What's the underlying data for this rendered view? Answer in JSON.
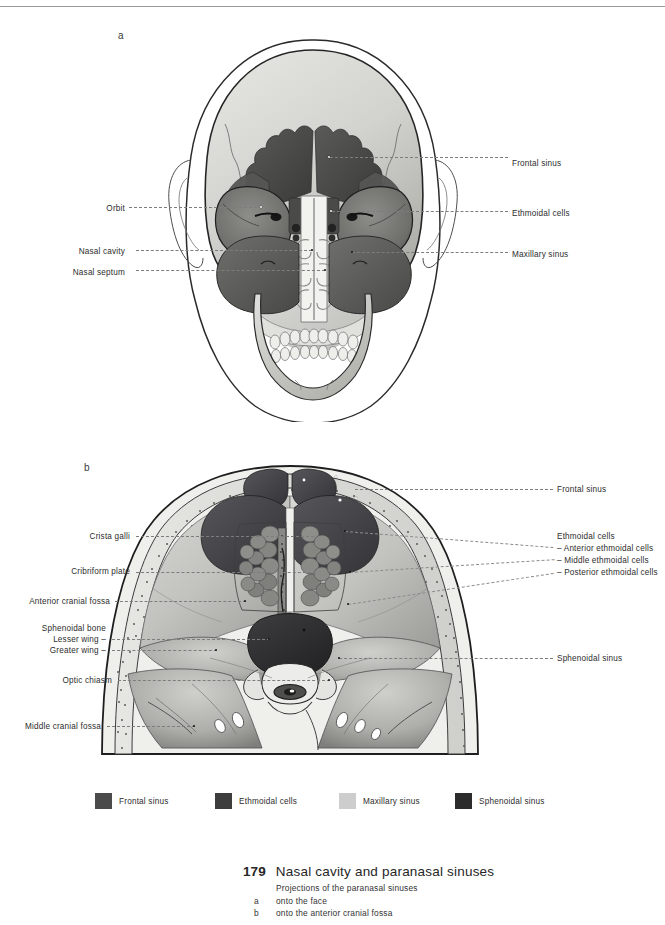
{
  "page": {
    "background": "#ffffff",
    "width": 665,
    "height": 925
  },
  "panels": {
    "a": {
      "letter": "a"
    },
    "b": {
      "letter": "b"
    }
  },
  "figure_a": {
    "view": "anterior view of skull with paranasal sinus projections onto the face",
    "labels_right": [
      {
        "text": "Frontal sinus",
        "x": 512,
        "y": 158,
        "line_from_x": 330,
        "line_y": 157
      },
      {
        "text": "Ethmoidal cells",
        "x": 512,
        "y": 208,
        "line_from_x": 332,
        "line_y": 211
      },
      {
        "text": "Maxillary sinus",
        "x": 512,
        "y": 249,
        "line_from_x": 352,
        "line_y": 252
      }
    ],
    "labels_left": [
      {
        "text": "Orbit",
        "x": 99,
        "y": 203,
        "line_to_x": 262,
        "line_y": 207
      },
      {
        "text": "Nasal cavity",
        "x": 82,
        "y": 246,
        "line_to_x": 312,
        "line_y": 250
      },
      {
        "text": "Nasal septum",
        "x": 69,
        "y": 267,
        "line_to_x": 325,
        "line_y": 270
      }
    ]
  },
  "figure_b": {
    "view": "anterior cranial fossa viewed from above with paranasal sinus projections",
    "labels_left": [
      {
        "text": "Crista galli",
        "x": 82,
        "y": 532,
        "line_to_x": 311,
        "line_y": 536
      },
      {
        "text": "Cribriform plate",
        "x": 58,
        "y": 567,
        "line_to_x": 312,
        "line_y": 572
      },
      {
        "text": "Anterior cranial fossa",
        "x": 8,
        "y": 597,
        "line_to_x": 245,
        "line_y": 601
      },
      {
        "text": "Sphenoidal bone",
        "x": 28,
        "y": 624,
        "line_to_x": null,
        "line_y": null
      },
      {
        "text": "Lesser wing –",
        "x": 38,
        "y": 636,
        "line_to_x": 269,
        "line_y": 639
      },
      {
        "text": "Greater wing –",
        "x": 31,
        "y": 648,
        "line_to_x": 216,
        "line_y": 650
      },
      {
        "text": "Optic chiasm",
        "x": 63,
        "y": 677,
        "line_to_x": 329,
        "line_y": 680
      },
      {
        "text": "Middle cranial fossa",
        "x": 18,
        "y": 724,
        "line_to_x": 194,
        "line_y": 726
      }
    ],
    "labels_right": [
      {
        "text": "Frontal sinus",
        "x": 557,
        "y": 487,
        "line_from_x": 355,
        "line_y": 489
      },
      {
        "text": "Ethmoidal cells",
        "x": 557,
        "y": 535,
        "line_from_x": null,
        "line_y": null
      },
      {
        "text": "– Anterior ethmoidal cells",
        "x": 557,
        "y": 547,
        "line_from_x": 345,
        "line_y": 531
      },
      {
        "text": "– Middle ethmoidal cells",
        "x": 557,
        "y": 559,
        "line_from_x": 350,
        "line_y": 572
      },
      {
        "text": "– Posterior ethmoidal cells",
        "x": 557,
        "y": 571,
        "line_from_x": 348,
        "line_y": 604
      },
      {
        "text": "Sphenoidal sinus",
        "x": 557,
        "y": 656,
        "line_from_x": 339,
        "line_y": 658
      }
    ]
  },
  "legend": {
    "items": [
      {
        "label": "Frontal sinus",
        "color": "#4b4b4b",
        "x": 95,
        "text_x": 122
      },
      {
        "label": "Ethmoidal cells",
        "color": "#3d3d3d",
        "x": 215,
        "text_x": 242
      },
      {
        "label": "Maxillary sinus",
        "color": "#cdcdcd",
        "x": 339,
        "text_x": 366
      },
      {
        "label": "Sphenoidal sinus",
        "color": "#2c2c2c",
        "x": 455,
        "text_x": 482
      }
    ]
  },
  "caption": {
    "number": "179",
    "title": "Nasal cavity and paranasal sinuses",
    "subtitle": "Projections of the paranasal sinuses",
    "items": [
      {
        "key": "a",
        "text": "onto the face"
      },
      {
        "key": "b",
        "text": "onto the anterior cranial fossa"
      }
    ]
  },
  "colors": {
    "frontal_sinus": "#4b4b4b",
    "ethmoidal_cells": "#3d3d3d",
    "maxillary_sinus": "#cdcdcd",
    "sphenoidal_sinus": "#2c2c2c",
    "bone_light": "#d9d9d6",
    "bone_mid": "#bfbfbb",
    "bone_shadow": "#9a9a96",
    "outline": "#1a1a1a",
    "leader": "#7d7d7d",
    "text": "#2d2d2d"
  }
}
